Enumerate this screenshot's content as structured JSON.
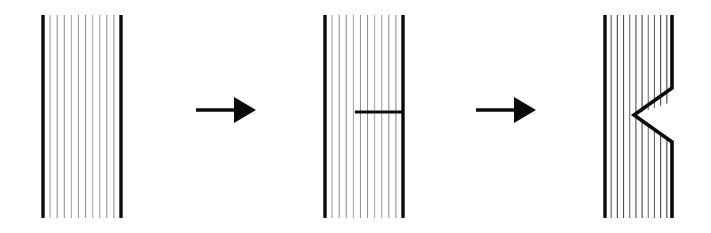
{
  "figure": {
    "background_color": "#ffffff",
    "ink_color": "#0b0b0b",
    "hatch_color": "#8d8d8d",
    "hatch_color_strong": "#4a4a4a",
    "stage_count": 3,
    "arrow_count": 2
  },
  "panels": [
    {
      "id": "panel-1",
      "name": "intact-specimen",
      "label": "Stage 1 — intact hatched block",
      "x": 43,
      "y": 15,
      "width": 78,
      "height": 203,
      "hatch_count": 10,
      "hatch_style": "faint",
      "left_edge": true,
      "right_edge": true,
      "feature": "none"
    },
    {
      "id": "panel-2",
      "name": "cracked-specimen",
      "label": "Stage 2 — horizontal crack from right edge",
      "x": 325,
      "y": 15,
      "width": 78,
      "height": 203,
      "hatch_count": 10,
      "hatch_style": "faint",
      "left_edge": true,
      "right_edge": true,
      "feature": "horizontal-crack",
      "crack": {
        "name": "horizontal-crack",
        "x_start": 355,
        "x_end": 403,
        "y": 112,
        "length": 48
      }
    },
    {
      "id": "panel-3",
      "name": "notched-specimen",
      "label": "Stage 3 — V-shaped notch opened at right edge",
      "x": 605,
      "y": 15,
      "width": 68,
      "height": 203,
      "hatch_count": 10,
      "hatch_style": "strong",
      "left_edge": true,
      "right_edge": false,
      "feature": "v-notch",
      "notch": {
        "name": "v-notch",
        "apex_x": 634,
        "apex_y": 115,
        "top_x": 672,
        "top_y": 88,
        "bottom_x": 672,
        "bottom_y": 142,
        "opening_height": 54,
        "depth": 38
      }
    }
  ],
  "arrows": [
    {
      "id": "arrow-1",
      "name": "transition-arrow-1",
      "label": "Stage 1 to Stage 2",
      "direction": "right",
      "x_start": 196,
      "x_end": 256,
      "y": 110,
      "head_length": 22,
      "head_half_width": 13
    },
    {
      "id": "arrow-2",
      "name": "transition-arrow-2",
      "label": "Stage 2 to Stage 3",
      "direction": "right",
      "x_start": 476,
      "x_end": 536,
      "y": 110,
      "head_length": 22,
      "head_half_width": 13
    }
  ]
}
